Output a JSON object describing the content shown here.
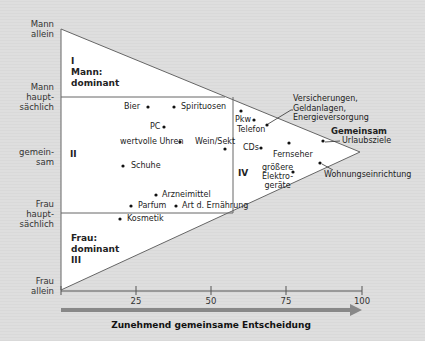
{
  "y_axis": {
    "labels": [
      "Mann allein",
      "Mann haupt-sächlich",
      "gemein-sam",
      "Frau haupt-sächlich",
      "Frau allein"
    ],
    "l0a": "Mann",
    "l0b": "allein",
    "l1a": "Mann",
    "l1b": "haupt-",
    "l1c": "sächlich",
    "l2a": "gemein-",
    "l2b": "sam",
    "l3a": "Frau",
    "l3b": "haupt-",
    "l3c": "sächlich",
    "l4a": "Frau",
    "l4b": "allein"
  },
  "regions": {
    "r1_num": "I",
    "r1_a": "Mann:",
    "r1_b": "dominant",
    "r2_num": "II",
    "r3_a": "Frau:",
    "r3_b": "dominant",
    "r3_num": "III",
    "r4_num": "IV",
    "common": "Gemeinsam"
  },
  "items": {
    "bier": "Bier",
    "spirituosen": "Spirituosen",
    "pc": "PC",
    "uhren": "wertvolle Uhren",
    "wein": "Wein/Sekt",
    "schuhe": "Schuhe",
    "arznei": "Arzneimittel",
    "parfum": "Parfum",
    "ernaehrung": "Art d. Ernährung",
    "kosmetik": "Kosmetik",
    "pkw": "Pkw",
    "telefon": "Telefon",
    "versich_a": "Versicherungen,",
    "versich_b": "Geldanlagen,",
    "versich_c": "Energieversorgung",
    "urlaub": "Urlaubsziele",
    "cds": "CDs",
    "fernseher": "Fernseher",
    "elektro_a": "größere",
    "elektro_b": "Elektro-",
    "elektro_c": "geräte",
    "wohnung": "Wohnungseinrichtung"
  },
  "x_axis": {
    "ticks": [
      "25",
      "50",
      "75",
      "100"
    ],
    "t25": "25",
    "t50": "50",
    "t75": "75",
    "t100": "100",
    "title": "Zunehmend gemeinsame Entscheidung"
  },
  "colors": {
    "triangle_fill": "#ffffff",
    "line": "#555555",
    "arrow": "#808080",
    "background": "#dcdcdc"
  }
}
